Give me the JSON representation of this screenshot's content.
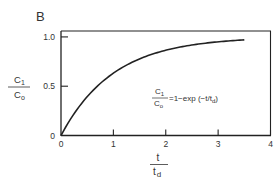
{
  "panel_label": "B",
  "chart_data": {
    "type": "line",
    "title": "",
    "xlabel_num": "t",
    "xlabel_den": "t_d",
    "xlabel_den_main": "t",
    "xlabel_den_sub": "d",
    "ylabel_num": "C_1",
    "ylabel_num_main": "C",
    "ylabel_num_sub": "1",
    "ylabel_den_main": "C",
    "ylabel_den_sub": "o",
    "xlim": [
      0,
      4
    ],
    "ylim": [
      0,
      1.06
    ],
    "xticks": [
      0,
      1,
      2,
      3,
      4
    ],
    "xtick_labels": [
      "0",
      "1",
      "2",
      "3",
      "4"
    ],
    "yticks": [
      0,
      0.5,
      1.0
    ],
    "ytick_labels": [
      "0",
      "0.5",
      "1.0"
    ],
    "grid": false,
    "series": [
      {
        "name": "C1/Co = 1 - exp(-t/td)",
        "function": "1-exp(-x)",
        "x_range": [
          0,
          3.5
        ],
        "x": [
          0,
          0.25,
          0.5,
          0.75,
          1.0,
          1.5,
          2.0,
          2.5,
          3.0,
          3.5
        ],
        "y": [
          0,
          0.221,
          0.393,
          0.528,
          0.632,
          0.777,
          0.865,
          0.918,
          0.95,
          0.97
        ]
      }
    ],
    "annotation": {
      "frac_num_main": "C",
      "frac_num_sub": "1",
      "frac_den_main": "C",
      "frac_den_sub": "o",
      "rhs": "=1−exp  (−t/t",
      "rhs_sub": "d",
      "rhs_close": ")",
      "position": "center-right"
    }
  }
}
